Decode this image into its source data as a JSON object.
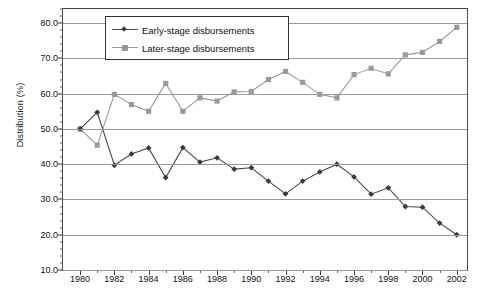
{
  "chart_data": {
    "type": "line",
    "title": "",
    "xlabel": "",
    "ylabel": "Distribution (%)",
    "xlim": [
      1979,
      2002.6
    ],
    "ylim": [
      10.0,
      84.0
    ],
    "grid": true,
    "legend_position": "top-center",
    "x": [
      1980,
      1981,
      1982,
      1983,
      1984,
      1985,
      1986,
      1987,
      1988,
      1989,
      1990,
      1991,
      1992,
      1993,
      1994,
      1995,
      1996,
      1997,
      1998,
      1999,
      2000,
      2001,
      2002
    ],
    "series": [
      {
        "name": "Early-stage disbursements",
        "color": "#4a4a4a",
        "marker": "diamond",
        "values": [
          50.0,
          54.7,
          39.7,
          42.9,
          44.6,
          36.2,
          44.7,
          40.6,
          41.8,
          38.6,
          39.0,
          35.2,
          31.6,
          35.2,
          37.8,
          40.0,
          36.4,
          31.5,
          33.3,
          28.0,
          27.8,
          23.3,
          20.0
        ]
      },
      {
        "name": "Later-stage disbursements",
        "color": "#9a9a9a",
        "marker": "square",
        "values": [
          50.0,
          45.4,
          59.8,
          56.9,
          55.0,
          62.9,
          55.0,
          58.8,
          57.9,
          60.5,
          60.6,
          64.0,
          66.3,
          63.2,
          59.8,
          58.8,
          65.4,
          67.2,
          65.6,
          71.0,
          71.7,
          74.8,
          78.8
        ]
      }
    ],
    "y_ticks": [
      10.0,
      20.0,
      30.0,
      40.0,
      50.0,
      60.0,
      70.0,
      80.0
    ],
    "y_tick_labels": [
      "10.0",
      "20.0",
      "30.0",
      "40.0",
      "50.0",
      "60.0",
      "70.0",
      "80.0"
    ],
    "x_ticks": [
      1980,
      1982,
      1984,
      1986,
      1988,
      1990,
      1992,
      1994,
      1996,
      1998,
      2000,
      2002
    ],
    "x_tick_labels": [
      "1980",
      "1982",
      "1984",
      "1986",
      "1988",
      "1990",
      "1992",
      "1994",
      "1996",
      "1998",
      "2000",
      "2002"
    ]
  },
  "legend": {
    "entries": [
      {
        "label": "Early-stage disbursements"
      },
      {
        "label": "Later-stage disbursements"
      }
    ]
  }
}
